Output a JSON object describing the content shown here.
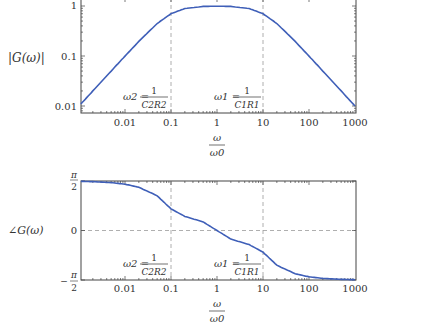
{
  "chart_data": [
    {
      "type": "line",
      "title": "",
      "xscale": "log",
      "yscale": "log",
      "xlabel": "ω / ω0",
      "ylabel": "|G(ω)|",
      "xlim": [
        0.0011,
        1000
      ],
      "ylim": [
        0.0075,
        1.13
      ],
      "xticks": [
        "0.01",
        "0.1",
        "1",
        "10",
        "100",
        "1000"
      ],
      "yticks": [
        "0.01",
        "0.1",
        "1"
      ],
      "grid": "dashed vertical lines at ω=0.1 and ω=10",
      "annotations": [
        "ω2 = 1/(C2R2)",
        "ω1 = 1/(C1R1)"
      ],
      "series": [
        {
          "name": "|G(ω)|",
          "color": "#3f5fb8",
          "x": [
            0.0011,
            0.002,
            0.005,
            0.01,
            0.02,
            0.05,
            0.1,
            0.2,
            0.5,
            1,
            2,
            5,
            10,
            20,
            50,
            100,
            200,
            500,
            1000
          ],
          "values": [
            0.011,
            0.02,
            0.05,
            0.0995,
            0.196,
            0.447,
            0.7,
            0.89,
            0.98,
            0.99,
            0.98,
            0.89,
            0.7,
            0.447,
            0.196,
            0.0995,
            0.05,
            0.02,
            0.01
          ]
        }
      ]
    },
    {
      "type": "line",
      "title": "",
      "xscale": "log",
      "xlabel": "ω / ω0",
      "ylabel": "∠G(ω)",
      "xlim": [
        0.0011,
        1000
      ],
      "ylim": [
        -1.5708,
        1.5708
      ],
      "xticks": [
        "0.01",
        "0.1",
        "1",
        "10",
        "100",
        "1000"
      ],
      "yticks": [
        "-π/2",
        "0",
        "π/2"
      ],
      "grid": "dashed vertical lines at ω=0.1 and ω=10; dashed horizontal line at 0",
      "annotations": [
        "ω2 = 1/(C2R2)",
        "ω1 = 1/(C1R1)"
      ],
      "series": [
        {
          "name": "∠G(ω)",
          "color": "#3f5fb8",
          "x": [
            0.0011,
            0.002,
            0.005,
            0.01,
            0.02,
            0.05,
            0.1,
            0.2,
            0.5,
            1,
            2,
            5,
            10,
            20,
            50,
            100,
            200,
            500,
            1000
          ],
          "values": [
            1.559,
            1.551,
            1.52,
            1.47,
            1.373,
            1.102,
            0.686,
            0.448,
            0.272,
            0.0,
            -0.272,
            -0.448,
            -0.686,
            -1.102,
            -1.373,
            -1.47,
            -1.52,
            -1.551,
            -1.56
          ]
        }
      ]
    }
  ],
  "magnitude": {
    "ylabel": "|G(ω)|",
    "yticks": {
      "t1": "1",
      "t01": "0.1",
      "t001": "0.01"
    },
    "xticks": [
      "0.01",
      "0.1",
      "1",
      "10",
      "100",
      "1000"
    ],
    "xlabel_num": "ω",
    "xlabel_den": "ω0",
    "ann_w2_lhs": "ω2 =",
    "ann_w2_num": "1",
    "ann_w2_den": "C2R2",
    "ann_w1_lhs": "ω1 =",
    "ann_w1_num": "1",
    "ann_w1_den": "C1R1"
  },
  "phase": {
    "ylabel": "∠G(ω)",
    "ytick_top_num": "π",
    "ytick_top_den": "2",
    "ytick_zero": "0",
    "ytick_bot_sign": "−",
    "ytick_bot_num": "π",
    "ytick_bot_den": "2",
    "xticks": [
      "0.01",
      "0.1",
      "1",
      "10",
      "100",
      "1000"
    ],
    "xlabel_num": "ω",
    "xlabel_den": "ω0",
    "ann_w2_lhs": "ω2 =",
    "ann_w2_num": "1",
    "ann_w2_den": "C2R2",
    "ann_w1_lhs": "ω1 =",
    "ann_w1_num": "1",
    "ann_w1_den": "C1R1"
  },
  "colors": {
    "curve": "#3f5fb8",
    "axis": "#444444",
    "grid": "#9a9a9a"
  }
}
